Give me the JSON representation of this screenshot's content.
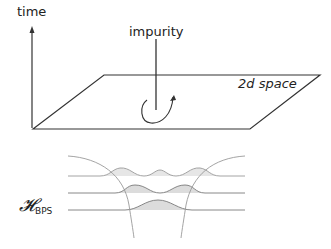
{
  "labels": {
    "time_axis": "time",
    "impurity": "impurity",
    "plane": "2d space",
    "hilbert_main": "𝓗",
    "hilbert_sub": "BPS"
  },
  "colors": {
    "line": "#333333",
    "wave_line": "#8a8a8a",
    "wave_fill": "#e2e2e2",
    "outer_curve": "#9a9a9a"
  }
}
